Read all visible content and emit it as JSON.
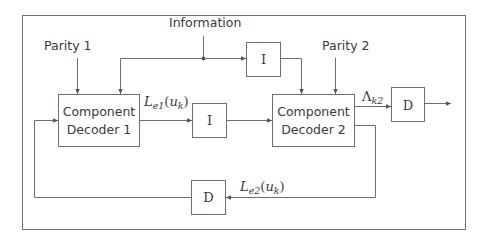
{
  "diagram": {
    "inputs": {
      "parity1": "Parity 1",
      "information": "Information",
      "parity2": "Parity 2"
    },
    "blocks": {
      "decoder1": {
        "line1": "Component",
        "line2": "Decoder 1"
      },
      "decoder2": {
        "line1": "Component",
        "line2": "Decoder 2"
      },
      "interleaver_top": "I",
      "interleaver_mid": "I",
      "deinterleaver_out": "D",
      "deinterleaver_feedback": "D"
    },
    "signals": {
      "le1": {
        "base": "L",
        "sub": "e1",
        "arg_open": "(",
        "arg": "u",
        "arg_sub": "k",
        "arg_close": ")"
      },
      "le2": {
        "base": "L",
        "sub": "e2",
        "arg_open": "(",
        "arg": "u",
        "arg_sub": "k",
        "arg_close": ")"
      },
      "lambda": {
        "base": "Λ",
        "sub": "k2"
      }
    },
    "colors": {
      "line": "#6e6e6e",
      "text": "#3a3a3a",
      "background": "#ffffff"
    }
  }
}
